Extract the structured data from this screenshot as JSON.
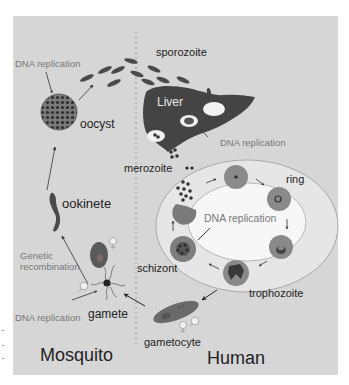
{
  "colors": {
    "panel_bg": "#d6d6d6",
    "cell_dark": "#4a4a4a",
    "cell_mid": "#7a7a7a",
    "rbc": "#8c8c8c",
    "ring_band": "#e6e6e6",
    "center_oval": "#f7f7f7",
    "text_dark": "#222222",
    "text_gray": "#7a7a7a"
  },
  "regions": {
    "mosquito": "Mosquito",
    "human": "Human"
  },
  "labels": {
    "sporozoite": "sporozoite",
    "liver": "Liver",
    "oocyst": "oocyst",
    "merozoite": "merozoite",
    "ring": "ring",
    "ookinete": "ookinete",
    "schizont": "schizont",
    "trophozoite": "trophozoite",
    "gamete": "gamete",
    "gametocyte": "gametocyte",
    "genetic_recombination_line1": "Genetic",
    "genetic_recombination_line2": "recombination",
    "dna_replication_oocyst": "DNA replication",
    "dna_replication_liver": "DNA replication",
    "dna_replication_center": "DNA replication",
    "dna_replication_gamete": "DNA replication"
  },
  "icons": {
    "female": "female-symbol",
    "male": "male-symbol"
  }
}
